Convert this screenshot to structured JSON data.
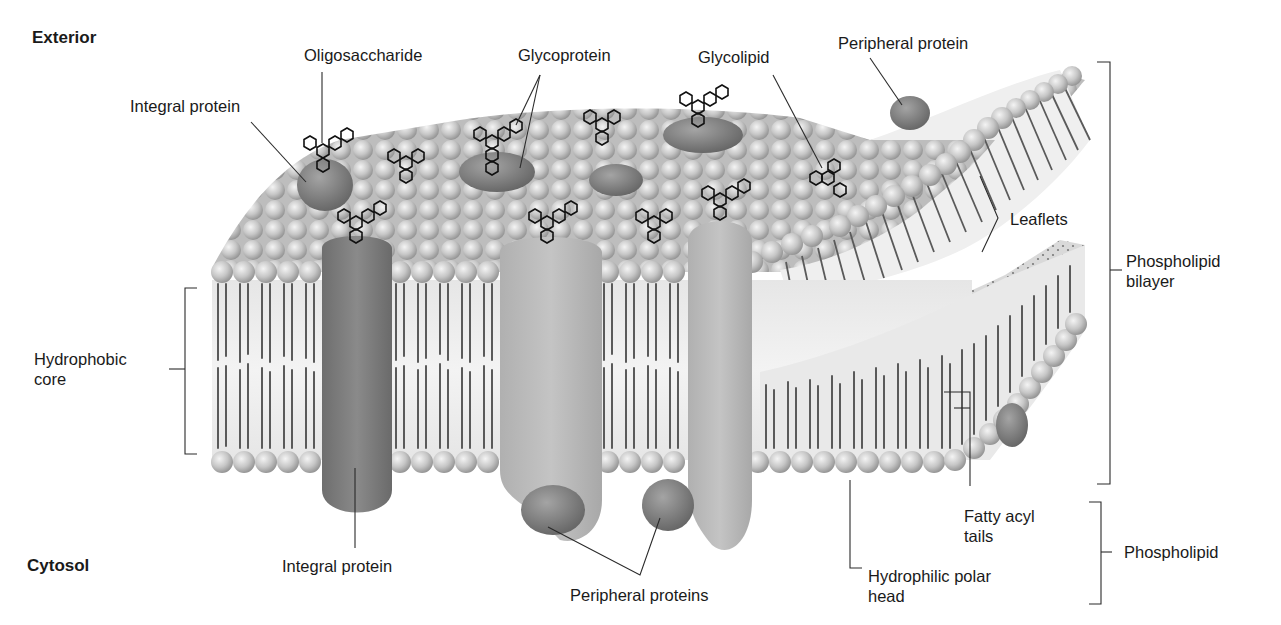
{
  "diagram": {
    "colors": {
      "background": "#ffffff",
      "text": "#1a1a1a",
      "leader_line": "#2a2a2a",
      "lipid_head": "#c8c8c8",
      "lipid_tail": "#5a5a5a",
      "bilayer_fill": "#ececec",
      "integral_protein_dark": "#7d7d7d",
      "integral_protein_light": "#b9b9b9",
      "peripheral_protein": "#8a8a8a",
      "oligosaccharide_stroke": "#111111"
    },
    "regions": {
      "exterior": "Exterior",
      "cytosol": "Cytosol"
    },
    "labels": {
      "oligosaccharide": "Oligosaccharide",
      "glycoprotein": "Glycoprotein",
      "glycolipid": "Glycolipid",
      "peripheral_protein_top": "Peripheral protein",
      "integral_protein_top": "Integral protein",
      "leaflets": "Leaflets",
      "phospholipid_bilayer": "Phospholipid\nbilayer",
      "hydrophobic_core": "Hydrophobic\ncore",
      "integral_protein_bottom": "Integral protein",
      "peripheral_proteins_bottom": "Peripheral proteins",
      "hydrophilic_polar_head": "Hydrophilic polar\nhead",
      "fatty_acyl_tails": "Fatty acyl\ntails",
      "phospholipid": "Phospholipid"
    }
  }
}
